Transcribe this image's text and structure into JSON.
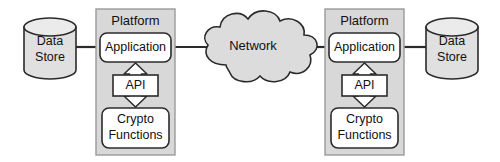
{
  "diagram": {
    "background_color": "#ffffff",
    "stroke_color": "#2b2b2b",
    "platform_fill": "#d8d8d8",
    "box_fill": "#ffffff",
    "cylinder_fill": "#e0e0e0",
    "cloud_fill": "#dcdcdc",
    "text_color": "#111111"
  },
  "left_side": {
    "data_store": {
      "line1": "Data",
      "line2": "Store"
    },
    "platform": {
      "title": "Platform",
      "application": "Application",
      "api": "API",
      "crypto": {
        "line1": "Crypto",
        "line2": "Functions"
      }
    }
  },
  "network": {
    "label": "Network"
  },
  "right_side": {
    "data_store": {
      "line1": "Data",
      "line2": "Store"
    },
    "platform": {
      "title": "Platform",
      "application": "Application",
      "api": "API",
      "crypto": {
        "line1": "Crypto",
        "line2": "Functions"
      }
    }
  },
  "connections": {
    "left_store_to_app": "link",
    "left_app_to_network": "link",
    "network_to_right_app": "link",
    "right_app_to_store": "link",
    "left_api_arrow": "bidirectional",
    "right_api_arrow": "bidirectional"
  }
}
